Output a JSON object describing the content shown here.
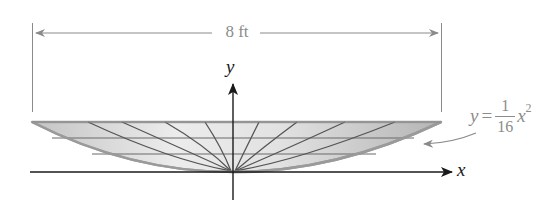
{
  "diagram": {
    "type": "parabolic-dish",
    "dimension": {
      "label": "8 ft"
    },
    "axes": {
      "x_label": "x",
      "y_label": "y"
    },
    "equation": {
      "lhs": "y",
      "equals": "=",
      "numerator": "1",
      "denominator": "16",
      "variable": "x",
      "exponent": "2"
    },
    "colors": {
      "dimension_line": "#8a8a8a",
      "axis": "#1a1a1a",
      "dish_fill_light": "#f1f1f1",
      "dish_fill_dark": "#bdbdbd",
      "dish_edge": "#9a9a9a",
      "grid_line": "#5a5a5a",
      "label_gray": "#8c8c8c"
    }
  }
}
